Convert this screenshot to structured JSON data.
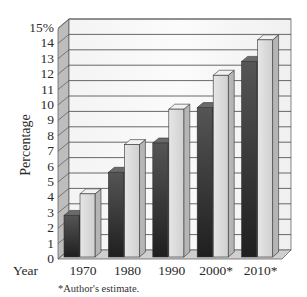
{
  "chart_data": {
    "type": "bar",
    "style": "3d-clustered-column",
    "title": "",
    "xlabel": "Year",
    "ylabel": "Percentage",
    "ylim": [
      0,
      15
    ],
    "y_ticks": [
      "0",
      "1",
      "2",
      "3",
      "4",
      "5",
      "6",
      "7",
      "8",
      "9",
      "10",
      "11",
      "12",
      "13",
      "14",
      "15%"
    ],
    "categories": [
      "1970",
      "1980",
      "1990",
      "2000*",
      "2010*"
    ],
    "series": [
      {
        "name": "Series 1 (dark)",
        "color": "#3a3a3a",
        "values": [
          2.7,
          5.5,
          7.4,
          9.7,
          12.7
        ]
      },
      {
        "name": "Series 2 (light)",
        "color": "#d9d9d9",
        "values": [
          4.1,
          7.3,
          9.6,
          11.8,
          14.1
        ]
      }
    ],
    "grid": true,
    "legend": "none",
    "annotations": [
      "*Author's estimate."
    ]
  },
  "labels": {
    "y_axis_title": "Percentage",
    "x_axis_title": "Year",
    "footnote": "*Author's estimate."
  }
}
